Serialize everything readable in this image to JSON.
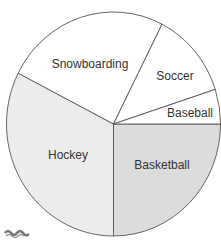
{
  "chart_data": {
    "type": "pie",
    "title": "",
    "categories": [
      "Basketball",
      "Hockey",
      "Snowboarding",
      "Soccer",
      "Baseball"
    ],
    "values": [
      25,
      32.5,
      25,
      12.5,
      5
    ],
    "colors": [
      "#dcdcdc",
      "#ececec",
      "#ffffff",
      "#ffffff",
      "#ffffff"
    ],
    "start_angle_deg": 0,
    "direction": "clockwise",
    "legend": "none",
    "labels_inside": true
  },
  "labels": {
    "basketball": "Basketball",
    "hockey": "Hockey",
    "snowboarding": "Snowboarding",
    "soccer": "Soccer",
    "baseball": "Baseball"
  }
}
